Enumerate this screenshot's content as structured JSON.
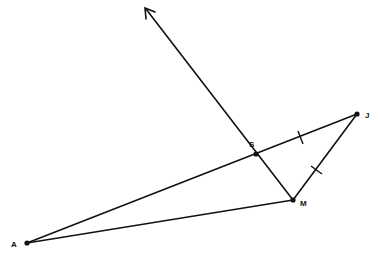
{
  "diagram": {
    "type": "geometry",
    "points": [
      {
        "id": "A",
        "label": "A",
        "x": 27,
        "y": 243,
        "label_x": 11,
        "label_y": 247
      },
      {
        "id": "M",
        "label": "M",
        "x": 293,
        "y": 200,
        "label_x": 300,
        "label_y": 206
      },
      {
        "id": "J",
        "label": "J",
        "x": 357,
        "y": 114,
        "label_x": 365,
        "label_y": 118
      },
      {
        "id": "S",
        "label": "S",
        "x": 256,
        "y": 154,
        "label_x": 249,
        "label_y": 147
      }
    ],
    "segments": [
      {
        "from": "A",
        "to": "J"
      },
      {
        "from": "A",
        "to": "M"
      },
      {
        "from": "M",
        "to": "J"
      }
    ],
    "ray": {
      "from": "M",
      "through": "S",
      "tip_x": 145,
      "tip_y": 8
    },
    "congruence_marks": [
      {
        "segment": "SJ",
        "x": 301,
        "y": 137
      },
      {
        "segment": "MJ",
        "x": 317,
        "y": 169
      }
    ],
    "line_color": "#111111",
    "background": "#ffffff"
  }
}
